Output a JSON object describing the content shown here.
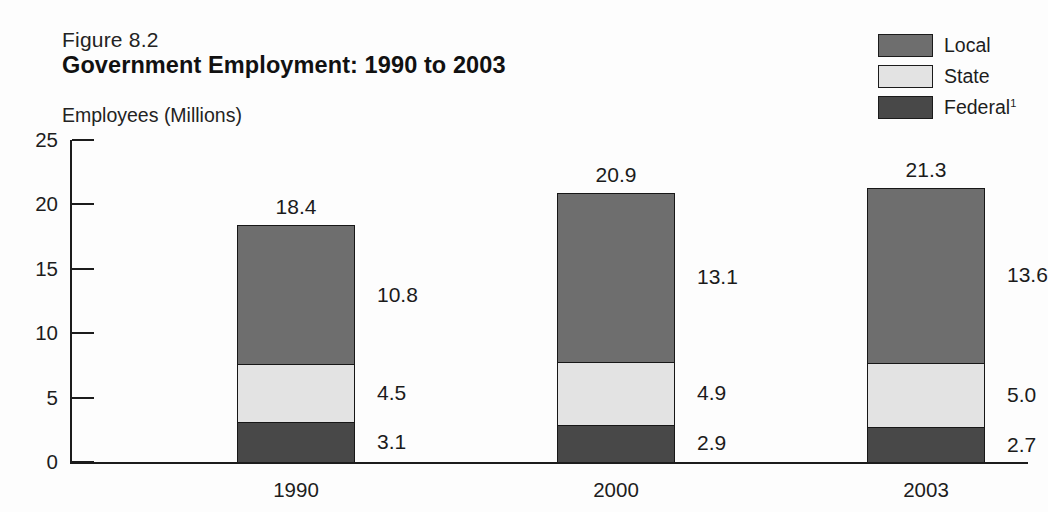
{
  "figure": {
    "number": "Figure 8.2",
    "title": "Government Employment: 1990 to 2003",
    "unit_label": "Employees (Millions)"
  },
  "legend": {
    "items": [
      {
        "label": "Local",
        "color": "#6e6e6e",
        "series": "local"
      },
      {
        "label": "State",
        "color": "#e3e3e3",
        "series": "state"
      },
      {
        "label": "Federal",
        "footnote": "1",
        "color": "#484848",
        "series": "federal"
      }
    ]
  },
  "axis": {
    "y_ticks": [
      "0",
      "5",
      "10",
      "15",
      "20",
      "25"
    ],
    "x_ticks": [
      "1990",
      "2000",
      "2003"
    ]
  },
  "bars": [
    {
      "category": "1990",
      "total": "18.4",
      "segments": [
        {
          "series": "federal",
          "label": "3.1",
          "value": 3.1
        },
        {
          "series": "state",
          "label": "4.5",
          "value": 4.5
        },
        {
          "series": "local",
          "label": "10.8",
          "value": 10.8
        }
      ]
    },
    {
      "category": "2000",
      "total": "20.9",
      "segments": [
        {
          "series": "federal",
          "label": "2.9",
          "value": 2.9
        },
        {
          "series": "state",
          "label": "4.9",
          "value": 4.9
        },
        {
          "series": "local",
          "label": "13.1",
          "value": 13.1
        }
      ]
    },
    {
      "category": "2003",
      "total": "21.3",
      "segments": [
        {
          "series": "federal",
          "label": "2.7",
          "value": 2.7
        },
        {
          "series": "state",
          "label": "5.0",
          "value": 5.0
        },
        {
          "series": "local",
          "label": "13.6",
          "value": 13.6
        }
      ]
    }
  ],
  "chart_data": {
    "type": "bar",
    "subtype": "stacked-vertical",
    "title": "Government Employment: 1990 to 2003",
    "subtitle": "Figure 8.2",
    "xlabel": "",
    "ylabel": "Employees (Millions)",
    "categories": [
      "1990",
      "2000",
      "2003"
    ],
    "series": [
      {
        "name": "Federal",
        "values": [
          3.1,
          2.9,
          2.7
        ],
        "color": "#484848"
      },
      {
        "name": "State",
        "values": [
          4.5,
          4.9,
          5.0
        ],
        "color": "#e3e3e3"
      },
      {
        "name": "Local",
        "values": [
          10.8,
          13.1,
          13.6
        ],
        "color": "#6e6e6e"
      }
    ],
    "totals": [
      18.4,
      20.9,
      21.3
    ],
    "ylim": [
      0,
      25
    ],
    "ytick_step": 5,
    "yticks": [
      0,
      5,
      10,
      15,
      20,
      25
    ],
    "grid": false,
    "legend_position": "top-right",
    "legend_entries": [
      "Local",
      "State",
      "Federal¹"
    ],
    "annotations": [
      "Footnote marker 1 on 'Federal' legend entry"
    ]
  }
}
